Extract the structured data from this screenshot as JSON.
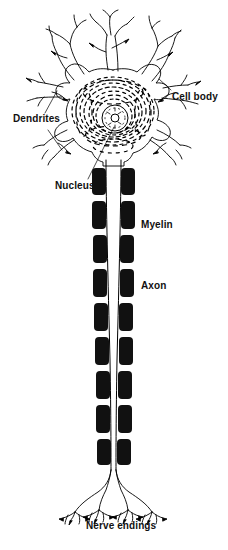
{
  "figure": {
    "background_color": "#ffffff",
    "ink_color": "#000000",
    "width": 228,
    "height": 550
  },
  "labels": {
    "dendrites": "Dendrites",
    "cell_body": "Cell body",
    "nucleus": "Nucleus",
    "myelin": "Myelin",
    "axon": "Axon",
    "nerve_endings": "Nerve endings"
  },
  "parts": {
    "soma": {
      "name": "cell body",
      "center_x": 113,
      "center_y": 110,
      "radius_x": 48,
      "radius_y": 40,
      "interior_pattern": "concentric dashed Nissl rings"
    },
    "nucleus": {
      "center_x": 115,
      "center_y": 118,
      "radius": 13,
      "nucleolus_radius": 4
    },
    "dendrites": {
      "count": 8,
      "description": "branching processes radiating from the cell body"
    },
    "axon": {
      "top_y": 160,
      "bottom_y": 470,
      "x": 113,
      "line_count": 2
    },
    "myelin_segments": {
      "count": 9,
      "shape": "rounded rectangle pairs flanking the axon",
      "fill": "#111111",
      "y_positions": [
        170,
        204,
        238,
        272,
        306,
        340,
        374,
        408,
        442
      ]
    },
    "nerve_endings": {
      "terminal_count": 4,
      "description": "branched terminal arborizations"
    }
  },
  "leader_lines": [
    {
      "from": "dendrites",
      "to_part": "upper-left dendrite"
    },
    {
      "from": "dendrites",
      "to_part": "lower-left dendrite"
    },
    {
      "from": "cell_body",
      "to_part": "soma right edge"
    },
    {
      "from": "nucleus",
      "to_part": "nucleus"
    }
  ]
}
